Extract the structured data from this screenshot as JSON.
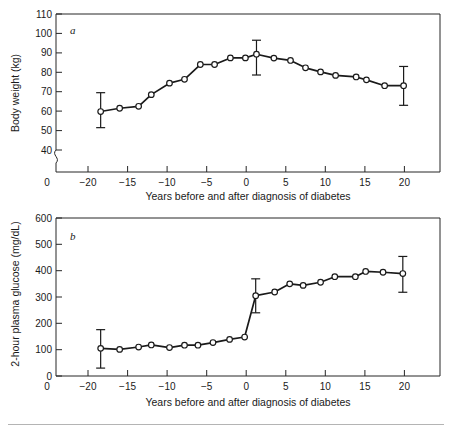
{
  "figure": {
    "background_color": "#ffffff",
    "line_color": "#1a1a1a",
    "marker_fill": "#ffffff",
    "axis_color": "#262626",
    "footer_rule_color": "#b4b4b4"
  },
  "panel_a": {
    "letter": "a",
    "ylabel": "Body weight (kg)",
    "xlabel": "Years before and after diagnosis of diabetes",
    "yticks": [
      "110",
      "100",
      "90",
      "80",
      "70",
      "60",
      "50",
      "40",
      "0"
    ],
    "xticks": [
      "0",
      "−20",
      "−15",
      "−10",
      "−5",
      "0",
      "5",
      "10",
      "15",
      "20"
    ],
    "axis_break": true
  },
  "panel_b": {
    "letter": "b",
    "ylabel": "2-hour plasma glucose (mg/dL)",
    "xlabel": "Years before and after diagnosis of diabetes",
    "yticks": [
      "600",
      "500",
      "400",
      "300",
      "200",
      "100",
      "0"
    ],
    "xticks": [
      "0",
      "−20",
      "−15",
      "−10",
      "−5",
      "0",
      "5",
      "10",
      "15",
      "20"
    ],
    "axis_break": false
  },
  "chart_data": [
    {
      "type": "line",
      "id": "panel_a",
      "title": "a",
      "xlabel": "Years before and after diagnosis of diabetes",
      "ylabel": "Body weight (kg)",
      "xlim": [
        -24.5,
        24.5
      ],
      "ylim": [
        35,
        110
      ],
      "yticks": [
        40,
        50,
        60,
        70,
        80,
        90,
        100,
        110
      ],
      "xticks": [
        -20,
        -15,
        -10,
        -5,
        0,
        5,
        10,
        15,
        20
      ],
      "y_axis_break_between": [
        0,
        40
      ],
      "grid": false,
      "legend": null,
      "marker": "open-circle",
      "series": [
        {
          "name": "Body weight",
          "x": [
            -18.4,
            -16.0,
            -13.6,
            -12.0,
            -9.7,
            -7.8,
            -5.8,
            -4.0,
            -2.0,
            -0.1,
            1.3,
            3.5,
            5.6,
            7.5,
            9.4,
            11.3,
            13.9,
            15.2,
            17.5,
            19.9
          ],
          "values": [
            59.8,
            61.5,
            62.5,
            68.5,
            74.4,
            76.4,
            84.0,
            84.0,
            87.4,
            87.4,
            89.3,
            87.3,
            86.1,
            82.3,
            80.2,
            78.4,
            77.6,
            76.1,
            73.1,
            73.1
          ],
          "errorbars": [
            {
              "x": -18.4,
              "y": 59.8,
              "lower": 51.5,
              "upper": 69.5
            },
            {
              "x": 1.3,
              "y": 89.3,
              "lower": 78.6,
              "upper": 96.5
            },
            {
              "x": 19.9,
              "y": 73.1,
              "lower": 63.0,
              "upper": 83.0
            }
          ]
        }
      ]
    },
    {
      "type": "line",
      "id": "panel_b",
      "title": "b",
      "xlabel": "Years before and after diagnosis of diabetes",
      "ylabel": "2-hour plasma glucose (mg/dL)",
      "xlim": [
        -24.5,
        24.5
      ],
      "ylim": [
        0,
        600
      ],
      "yticks": [
        0,
        100,
        200,
        300,
        400,
        500,
        600
      ],
      "xticks": [
        -20,
        -15,
        -10,
        -5,
        0,
        5,
        10,
        15,
        20
      ],
      "grid": false,
      "legend": null,
      "marker": "open-circle",
      "series": [
        {
          "name": "2-hour plasma glucose",
          "x": [
            -18.4,
            -16.0,
            -13.6,
            -12.0,
            -9.7,
            -7.8,
            -6.1,
            -4.2,
            -2.1,
            -0.2,
            1.2,
            3.6,
            5.5,
            7.2,
            9.4,
            11.2,
            13.8,
            15.1,
            17.3,
            19.8
          ],
          "values": [
            105,
            101,
            110,
            118,
            108,
            117,
            117,
            127,
            139,
            148,
            305,
            319,
            350,
            344,
            356,
            377,
            377,
            397,
            394,
            389
          ],
          "errorbars": [
            {
              "x": -18.4,
              "y": 105,
              "lower": 30,
              "upper": 176
            },
            {
              "x": 1.2,
              "y": 305,
              "lower": 240,
              "upper": 369
            },
            {
              "x": 19.8,
              "y": 389,
              "lower": 318,
              "upper": 454
            }
          ]
        }
      ]
    }
  ]
}
